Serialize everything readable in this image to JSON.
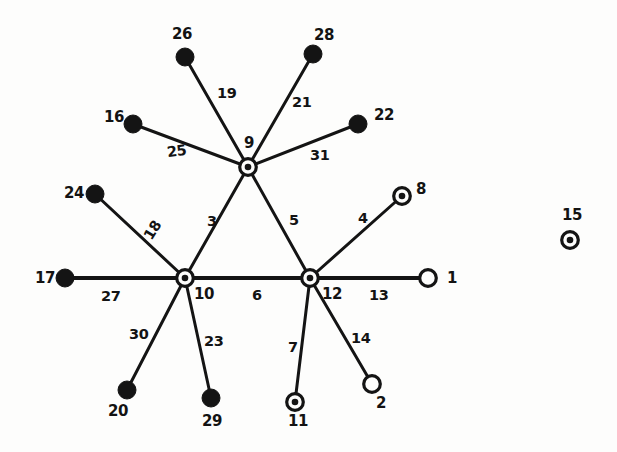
{
  "figure": {
    "type": "graph-diagram",
    "background_color": "#fdfdfc",
    "ink_color": "#141414",
    "width": 617,
    "height": 452
  },
  "legend_note": {
    "filled": "solid black disc node",
    "ring": "circle with centered dot node",
    "hollow": "open circle node"
  },
  "nodes": [
    {
      "id": "1",
      "label": "1",
      "style": "hollow",
      "cx": 428,
      "cy": 278,
      "r": 9.5,
      "label_x": 447,
      "label_y": 271
    },
    {
      "id": "2",
      "label": "2",
      "style": "hollow",
      "cx": 372,
      "cy": 384,
      "r": 9.5,
      "label_x": 376,
      "label_y": 396
    },
    {
      "id": "8",
      "label": "8",
      "style": "ring",
      "cx": 402,
      "cy": 196,
      "r": 9.5,
      "label_x": 416,
      "label_y": 182
    },
    {
      "id": "9",
      "label": "9",
      "style": "ring",
      "cx": 248,
      "cy": 167,
      "r": 9.5,
      "label_x": 244,
      "label_y": 136
    },
    {
      "id": "10",
      "label": "10",
      "style": "ring",
      "cx": 185,
      "cy": 278,
      "r": 9.5,
      "label_x": 194,
      "label_y": 287
    },
    {
      "id": "11",
      "label": "11",
      "style": "ring",
      "cx": 295,
      "cy": 402,
      "r": 9.5,
      "label_x": 288,
      "label_y": 414
    },
    {
      "id": "12",
      "label": "12",
      "style": "ring",
      "cx": 310,
      "cy": 278,
      "r": 9.5,
      "label_x": 322,
      "label_y": 287
    },
    {
      "id": "15",
      "label": "15",
      "style": "ring",
      "cx": 570,
      "cy": 240,
      "r": 9.5,
      "label_x": 562,
      "label_y": 208
    },
    {
      "id": "16",
      "label": "16",
      "style": "filled",
      "cx": 133,
      "cy": 124,
      "r": 9.0,
      "label_x": 104,
      "label_y": 110
    },
    {
      "id": "17",
      "label": "17",
      "style": "filled",
      "cx": 65,
      "cy": 278,
      "r": 9.0,
      "label_x": 35,
      "label_y": 271
    },
    {
      "id": "20",
      "label": "20",
      "style": "filled",
      "cx": 127,
      "cy": 390,
      "r": 9.0,
      "label_x": 108,
      "label_y": 404
    },
    {
      "id": "22",
      "label": "22",
      "style": "filled",
      "cx": 358,
      "cy": 124,
      "r": 9.0,
      "label_x": 374,
      "label_y": 108
    },
    {
      "id": "24",
      "label": "24",
      "style": "filled",
      "cx": 95,
      "cy": 194,
      "r": 9.0,
      "label_x": 64,
      "label_y": 186
    },
    {
      "id": "26",
      "label": "26",
      "style": "filled",
      "cx": 185,
      "cy": 57,
      "r": 9.0,
      "label_x": 172,
      "label_y": 27
    },
    {
      "id": "28",
      "label": "28",
      "style": "filled",
      "cx": 313,
      "cy": 54,
      "r": 9.0,
      "label_x": 314,
      "label_y": 28
    },
    {
      "id": "29",
      "label": "29",
      "style": "filled",
      "cx": 211,
      "cy": 398,
      "r": 9.0,
      "label_x": 202,
      "label_y": 414
    }
  ],
  "edges": [
    {
      "id": "e3",
      "label": "3",
      "from": "9",
      "to": "10",
      "width": 3.0,
      "label_x": 207,
      "label_y": 214,
      "rotate": 0
    },
    {
      "id": "e4",
      "label": "4",
      "from": "12",
      "to": "8",
      "width": 3.0,
      "label_x": 358,
      "label_y": 211,
      "rotate": 0
    },
    {
      "id": "e5",
      "label": "5",
      "from": "9",
      "to": "12",
      "width": 3.0,
      "label_x": 289,
      "label_y": 213,
      "rotate": 0
    },
    {
      "id": "e6",
      "label": "6",
      "from": "10",
      "to": "12",
      "width": 4.0,
      "label_x": 252,
      "label_y": 288,
      "rotate": 0
    },
    {
      "id": "e7",
      "label": "7",
      "from": "12",
      "to": "11",
      "width": 3.0,
      "label_x": 288,
      "label_y": 340,
      "rotate": 0
    },
    {
      "id": "e13",
      "label": "13",
      "from": "12",
      "to": "1",
      "width": 4.0,
      "label_x": 369,
      "label_y": 288,
      "rotate": 0
    },
    {
      "id": "e14",
      "label": "14",
      "from": "12",
      "to": "2",
      "width": 3.0,
      "label_x": 351,
      "label_y": 331,
      "rotate": 0
    },
    {
      "id": "e18",
      "label": "18",
      "from": "10",
      "to": "24",
      "width": 3.0,
      "label_x": 143,
      "label_y": 223,
      "rotate": -58
    },
    {
      "id": "e19",
      "label": "19",
      "from": "9",
      "to": "26",
      "width": 3.0,
      "label_x": 217,
      "label_y": 86,
      "rotate": 0
    },
    {
      "id": "e21",
      "label": "21",
      "from": "9",
      "to": "28",
      "width": 3.0,
      "label_x": 292,
      "label_y": 95,
      "rotate": 0
    },
    {
      "id": "e23",
      "label": "23",
      "from": "10",
      "to": "29",
      "width": 3.0,
      "label_x": 204,
      "label_y": 334,
      "rotate": 0
    },
    {
      "id": "e25",
      "label": "25",
      "from": "9",
      "to": "16",
      "width": 3.0,
      "label_x": 167,
      "label_y": 144,
      "rotate": -8
    },
    {
      "id": "e27",
      "label": "27",
      "from": "10",
      "to": "17",
      "width": 4.0,
      "label_x": 101,
      "label_y": 289,
      "rotate": 0
    },
    {
      "id": "e30",
      "label": "30",
      "from": "10",
      "to": "20",
      "width": 3.0,
      "label_x": 129,
      "label_y": 327,
      "rotate": 0
    },
    {
      "id": "e31",
      "label": "31",
      "from": "9",
      "to": "22",
      "width": 3.0,
      "label_x": 310,
      "label_y": 148,
      "rotate": 0
    }
  ]
}
